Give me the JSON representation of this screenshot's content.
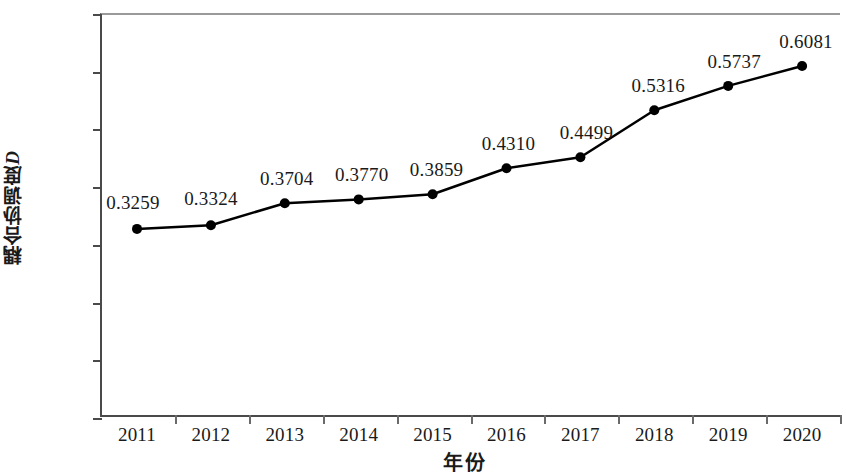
{
  "chart_data": {
    "type": "line",
    "title": "",
    "xlabel": "年份",
    "ylabel": "耦合协调度D",
    "ylabel_main": "耦合协调度",
    "ylabel_italic": "D",
    "categories": [
      "2011",
      "2012",
      "2013",
      "2014",
      "2015",
      "2016",
      "2017",
      "2018",
      "2019",
      "2020"
    ],
    "values": [
      0.3259,
      0.3324,
      0.3704,
      0.377,
      0.3859,
      0.431,
      0.4499,
      0.5316,
      0.5737,
      0.6081
    ],
    "point_labels": [
      "0.3259",
      "0.3324",
      "0.3704",
      "0.3770",
      "0.3859",
      "0.4310",
      "0.4499",
      "0.5316",
      "0.5737",
      "0.6081"
    ],
    "ylim": [
      0,
      0.7
    ],
    "ytick_values": [
      0,
      0.1,
      0.2,
      0.3,
      0.4,
      0.5,
      0.6,
      0.7
    ],
    "ytick_labels": [
      "0",
      "0.1000",
      "0.2000",
      "0.3000",
      "0.4000",
      "0.5000",
      "0.6000",
      "0.7000"
    ],
    "grid": false,
    "legend": false,
    "series_color": "#000000",
    "axis_color": "#4a4a4a",
    "marker": "filled-circle",
    "line_width": 2.5
  }
}
